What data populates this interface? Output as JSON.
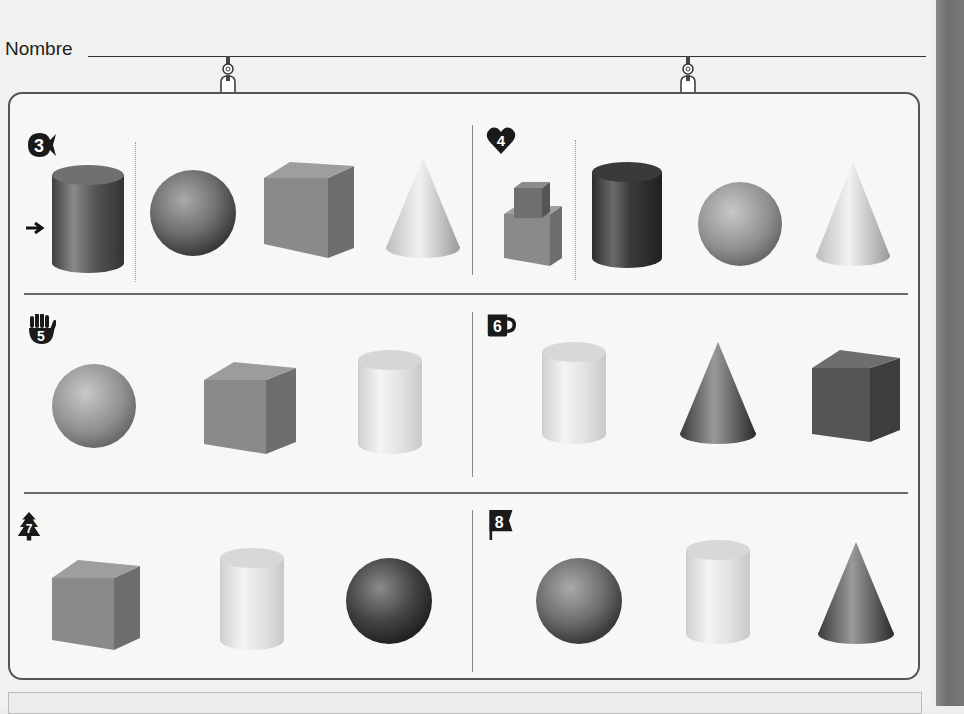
{
  "header": {
    "name_label": "Nombre"
  },
  "colors": {
    "frame_border": "#555555",
    "badge_fill": "#1a1a1a",
    "dark_shape": "#3c3c3c",
    "mid_shape": "#7d7d7d",
    "light_shape": "#dcdcdc"
  },
  "sections": [
    {
      "number": "3",
      "badge_icon": "fish-icon",
      "has_arrow": true,
      "example": "cylinder",
      "shapes": [
        "cylinder",
        "sphere",
        "cube",
        "cone"
      ]
    },
    {
      "number": "4",
      "badge_icon": "heart-icon",
      "example": "stacked-cubes",
      "shapes": [
        "stacked-cubes",
        "cylinder",
        "sphere",
        "cone"
      ]
    },
    {
      "number": "5",
      "badge_icon": "hand-icon",
      "shapes": [
        "sphere",
        "cube",
        "cylinder"
      ]
    },
    {
      "number": "6",
      "badge_icon": "mug-icon",
      "shapes": [
        "cylinder",
        "cone",
        "cube"
      ]
    },
    {
      "number": "7",
      "badge_icon": "tree-icon",
      "shapes": [
        "rectangular-prism",
        "cylinder",
        "ellipsoid"
      ]
    },
    {
      "number": "8",
      "badge_icon": "flag-icon",
      "shapes": [
        "ellipsoid",
        "cylinder",
        "cone"
      ]
    }
  ]
}
